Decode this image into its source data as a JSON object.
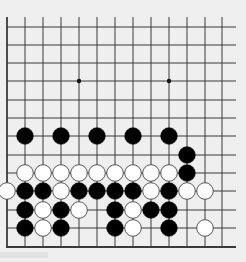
{
  "board": {
    "background": "#efefef",
    "line_color": "#3a3a3a",
    "black_color": "#000000",
    "white_color": "#ffffff",
    "columns_x": [
      7,
      25,
      43,
      61,
      79,
      97,
      115,
      133,
      151,
      169,
      187,
      205,
      222
    ],
    "rows_y": [
      27,
      45,
      63,
      81,
      100,
      118,
      136,
      155,
      173,
      191,
      210,
      228
    ],
    "top_y": 17,
    "bottom_edge_y": 247,
    "right_extent_x": 236,
    "stone_radius": 8.3,
    "star_points": [
      {
        "col": 4,
        "row": 3
      },
      {
        "col": 9,
        "row": 3
      }
    ],
    "stones": [
      {
        "color": "black",
        "col": 1,
        "row": 6
      },
      {
        "color": "black",
        "col": 3,
        "row": 6
      },
      {
        "color": "black",
        "col": 5,
        "row": 6
      },
      {
        "color": "black",
        "col": 7,
        "row": 6
      },
      {
        "color": "black",
        "col": 9,
        "row": 6
      },
      {
        "color": "black",
        "col": 10,
        "row": 7
      },
      {
        "color": "white",
        "col": 1,
        "row": 8
      },
      {
        "color": "white",
        "col": 2,
        "row": 8
      },
      {
        "color": "white",
        "col": 3,
        "row": 8
      },
      {
        "color": "white",
        "col": 4,
        "row": 8
      },
      {
        "color": "white",
        "col": 5,
        "row": 8
      },
      {
        "color": "white",
        "col": 6,
        "row": 8
      },
      {
        "color": "white",
        "col": 7,
        "row": 8
      },
      {
        "color": "white",
        "col": 8,
        "row": 8
      },
      {
        "color": "white",
        "col": 9,
        "row": 8
      },
      {
        "color": "black",
        "col": 10,
        "row": 8
      },
      {
        "color": "white",
        "col": 0,
        "row": 9
      },
      {
        "color": "black",
        "col": 1,
        "row": 9
      },
      {
        "color": "black",
        "col": 2,
        "row": 9
      },
      {
        "color": "white",
        "col": 3,
        "row": 9
      },
      {
        "color": "black",
        "col": 4,
        "row": 9
      },
      {
        "color": "black",
        "col": 5,
        "row": 9
      },
      {
        "color": "black",
        "col": 6,
        "row": 9
      },
      {
        "color": "black",
        "col": 7,
        "row": 9
      },
      {
        "color": "white",
        "col": 8,
        "row": 9
      },
      {
        "color": "black",
        "col": 9,
        "row": 9
      },
      {
        "color": "white",
        "col": 10,
        "row": 9
      },
      {
        "color": "white",
        "col": 11,
        "row": 9
      },
      {
        "color": "black",
        "col": 1,
        "row": 10
      },
      {
        "color": "white",
        "col": 2,
        "row": 10
      },
      {
        "color": "black",
        "col": 3,
        "row": 10
      },
      {
        "color": "white",
        "col": 4,
        "row": 10
      },
      {
        "color": "black",
        "col": 6,
        "row": 10
      },
      {
        "color": "white",
        "col": 7,
        "row": 10
      },
      {
        "color": "black",
        "col": 8,
        "row": 10
      },
      {
        "color": "black",
        "col": 9,
        "row": 10
      },
      {
        "color": "black",
        "col": 1,
        "row": 11
      },
      {
        "color": "white",
        "col": 2,
        "row": 11
      },
      {
        "color": "black",
        "col": 3,
        "row": 11
      },
      {
        "color": "black",
        "col": 6,
        "row": 11
      },
      {
        "color": "white",
        "col": 7,
        "row": 11
      },
      {
        "color": "black",
        "col": 9,
        "row": 11
      },
      {
        "color": "white",
        "col": 11,
        "row": 11
      }
    ]
  }
}
